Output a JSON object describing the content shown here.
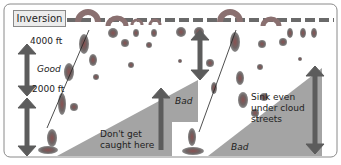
{
  "diagram": {
    "inversion_label": "Inversion",
    "altitude_upper": "4000 ft",
    "altitude_lower": "2000 ft",
    "good_label": "Good",
    "bad_label_middle": "Bad",
    "bad_label_right": "Bad",
    "warning_left_line1": "Don't get",
    "warning_left_line2": "caught here",
    "note_right_line1": "Sink even",
    "note_right_line2": "under cloud",
    "note_right_line3": "streets"
  },
  "colors": {
    "arrow": "#5c5c5c",
    "sink_area": "#a4a4a4",
    "thermal_blob": "#7a6a6a",
    "inversion_line": "#6a6a6a",
    "frame": "#8a8a8a"
  }
}
